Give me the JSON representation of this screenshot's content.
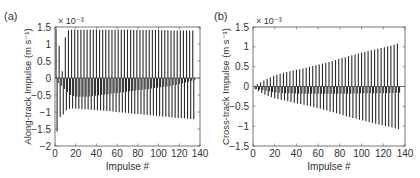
{
  "chart_data": [
    {
      "panel_label": "(a)",
      "type": "bar",
      "style": "stem",
      "title": "",
      "xlabel": "Impulse #",
      "ylabel": "Along-track Impulse (m s⁻¹)",
      "y_multiplier": "× 10⁻³",
      "xlim": [
        0,
        140
      ],
      "ylim": [
        -2,
        1.5
      ],
      "xticks": [
        0,
        20,
        40,
        60,
        80,
        100,
        120,
        140
      ],
      "yticks": [
        -2,
        -1.5,
        -1,
        -0.5,
        0,
        0.5,
        1,
        1.5
      ],
      "ytick_labels": [
        "-2",
        "-1.5",
        "-1",
        "-0.5",
        "0",
        "0.5",
        "1",
        "1.5"
      ],
      "grid": false,
      "zero_line": true,
      "n_impulses": 135,
      "series": [
        {
          "name": "positive impulses (odd-numbered pulses)",
          "x": [
            1,
            3,
            5,
            7,
            9,
            11,
            13,
            15,
            20,
            30,
            40,
            50,
            60,
            70,
            80,
            90,
            100,
            110,
            120,
            130,
            135
          ],
          "values": [
            1.45,
            1.0,
            0.9,
            0.2,
            1.1,
            1.3,
            1.4,
            1.42,
            1.42,
            1.42,
            1.42,
            1.42,
            1.42,
            1.42,
            1.41,
            1.41,
            1.41,
            1.4,
            1.4,
            1.4,
            1.4
          ]
        },
        {
          "name": "negative impulse envelope (long)",
          "x": [
            1,
            3,
            5,
            7,
            9,
            11,
            13,
            15,
            20,
            30,
            40,
            50,
            60,
            70,
            80,
            90,
            100,
            110,
            120,
            130,
            135
          ],
          "values": [
            -1.85,
            -1.3,
            -1.15,
            -1.1,
            -1.05,
            -0.95,
            -0.92,
            -0.9,
            -0.9,
            -0.92,
            -0.95,
            -0.97,
            -1.0,
            -1.03,
            -1.06,
            -1.09,
            -1.12,
            -1.15,
            -1.18,
            -1.2,
            -1.22
          ]
        },
        {
          "name": "negative impulse envelope (short)",
          "x": [
            1,
            5,
            10,
            15,
            20,
            30,
            40,
            50,
            60,
            70,
            80,
            90,
            100,
            110,
            120,
            130,
            135
          ],
          "values": [
            -0.1,
            -0.2,
            -0.35,
            -0.5,
            -0.55,
            -0.55,
            -0.52,
            -0.48,
            -0.44,
            -0.4,
            -0.36,
            -0.32,
            -0.28,
            -0.24,
            -0.18,
            -0.1,
            -0.05
          ]
        }
      ]
    },
    {
      "panel_label": "(b)",
      "type": "bar",
      "style": "stem",
      "title": "",
      "xlabel": "Impulse #",
      "ylabel": "Cross-track Impulse (m s⁻¹)",
      "y_multiplier": "× 10⁻³",
      "xlim": [
        0,
        140
      ],
      "ylim": [
        -1.5,
        1.5
      ],
      "xticks": [
        0,
        20,
        40,
        60,
        80,
        100,
        120,
        140
      ],
      "yticks": [
        -1.5,
        -1,
        -0.5,
        0,
        0.5,
        1,
        1.5
      ],
      "ytick_labels": [
        "-1.5",
        "-1",
        "-0.5",
        "0",
        "0.5",
        "1",
        "1.5"
      ],
      "grid": false,
      "zero_line": true,
      "n_impulses": 135,
      "series": [
        {
          "name": "positive impulse envelope",
          "x": [
            1,
            10,
            20,
            30,
            40,
            50,
            60,
            70,
            80,
            90,
            100,
            110,
            120,
            130,
            135
          ],
          "values": [
            0.02,
            0.15,
            0.28,
            0.36,
            0.42,
            0.48,
            0.55,
            0.62,
            0.7,
            0.78,
            0.85,
            0.92,
            0.98,
            1.05,
            1.1
          ]
        },
        {
          "name": "negative impulse envelope (long)",
          "x": [
            1,
            10,
            20,
            30,
            40,
            50,
            60,
            70,
            80,
            90,
            100,
            110,
            120,
            130,
            135
          ],
          "values": [
            -0.05,
            -0.2,
            -0.3,
            -0.36,
            -0.42,
            -0.48,
            -0.55,
            -0.62,
            -0.7,
            -0.78,
            -0.85,
            -0.92,
            -0.98,
            -1.05,
            -1.08
          ]
        },
        {
          "name": "negative impulse envelope (short)",
          "x": [
            1,
            10,
            20,
            30,
            40,
            50,
            60,
            70,
            80,
            90,
            100,
            110,
            120,
            130,
            135
          ],
          "values": [
            -0.05,
            -0.1,
            -0.15,
            -0.17,
            -0.18,
            -0.18,
            -0.18,
            -0.18,
            -0.18,
            -0.18,
            -0.17,
            -0.17,
            -0.17,
            -0.16,
            -0.16
          ]
        }
      ]
    }
  ],
  "layout": {
    "panels": [
      {
        "left": 55,
        "top": 27,
        "right": 200,
        "bottom": 146
      },
      {
        "left": 253,
        "top": 27,
        "right": 405,
        "bottom": 146
      }
    ],
    "stem_color": "#2a2a2a",
    "axis_color": "#555555",
    "zero_line_color": "#444444"
  }
}
